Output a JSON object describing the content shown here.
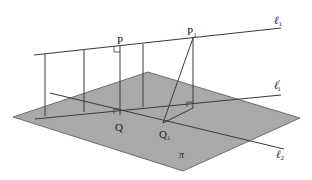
{
  "diagram": {
    "labels": {
      "P": "P",
      "P1": "P",
      "P1_sub": "1",
      "Q": "Q",
      "Q1": "Q",
      "Q1_sub": "1",
      "l1": "ℓ",
      "l1_sub": "1",
      "l1prime": "ℓ",
      "l1prime_sub": "1",
      "l1prime_mark": "′",
      "l2": "ℓ",
      "l2_sub": "2",
      "pi": "π"
    },
    "colors": {
      "plane_fill": "#a9a9a9",
      "line": "#3a3a3a",
      "background": "#ffffff"
    }
  }
}
